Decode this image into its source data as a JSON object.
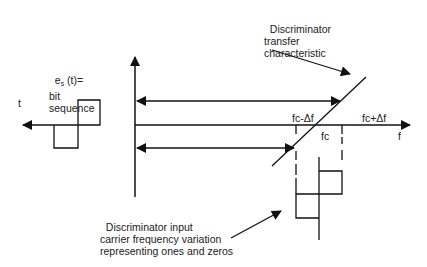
{
  "diagram": {
    "labels": {
      "bit_sequence_line1": "e",
      "bit_sequence_sub": "s",
      "bit_sequence_line1b": " (t)=",
      "bit_sequence_line2": "bit",
      "bit_sequence_line3": "sequence",
      "time_axis": "t",
      "transfer_line1": "Discriminator",
      "transfer_line2": "transfer",
      "transfer_line3": "characteristic",
      "freq_axis": "f",
      "fc_minus": "fc-Δf",
      "fc": "fc",
      "fc_plus": "fc+Δf",
      "input_line1": "Discriminator input",
      "input_line2": "carrier frequency variation",
      "input_line3": "representing ones and zeros"
    },
    "colors": {
      "line": "#111111",
      "text": "#222222",
      "background": "#ffffff"
    }
  }
}
